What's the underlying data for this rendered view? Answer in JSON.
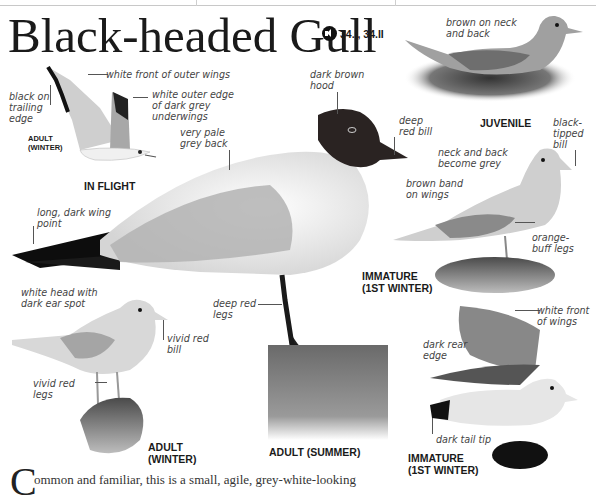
{
  "page": {
    "title": "Black-headed Gull",
    "audio": {
      "icon": "speaker-icon",
      "tracks": "34.I, 34.II"
    },
    "body_text": {
      "drop_cap": "C",
      "text": "ommon and familiar, this is a small, agile, grey-white-looking"
    }
  },
  "figures": [
    {
      "id": "in-flight",
      "caption": "IN FLIGHT",
      "sub_caption": "ADULT\n(WINTER)",
      "labels": [
        "white front of outer wings",
        "white outer edge\nof dark grey\nunderwings",
        "black on\ntrailing\nedge"
      ]
    },
    {
      "id": "adult-summer",
      "caption": "ADULT (SUMMER)",
      "labels": [
        "dark brown\nhood",
        "deep\nred bill",
        "very pale\ngrey back",
        "long, dark wing\npoint",
        "deep red\nlegs"
      ]
    },
    {
      "id": "juvenile",
      "caption": "JUVENILE",
      "labels": [
        "brown on neck\nand back"
      ]
    },
    {
      "id": "immature-standing",
      "caption": "IMMATURE\n(1ST WINTER)",
      "labels": [
        "black-\ntipped\nbill",
        "neck and back\nbecome grey",
        "brown band\non wings",
        "orange-\nbuff legs"
      ]
    },
    {
      "id": "adult-winter",
      "caption": "ADULT\n(WINTER)",
      "labels": [
        "white head with\ndark ear spot",
        "vivid red\nbill",
        "vivid red\nlegs"
      ]
    },
    {
      "id": "immature-flying",
      "caption": "IMMATURE\n(1ST WINTER)",
      "labels": [
        "white front\nof wings",
        "dark rear\nedge",
        "dark tail tip"
      ]
    }
  ],
  "colors": {
    "text": "#1a1a1a",
    "label": "#444444",
    "hood": "#2a2322",
    "grey_wing": "#a9a9a9",
    "black_tip": "#111111"
  }
}
